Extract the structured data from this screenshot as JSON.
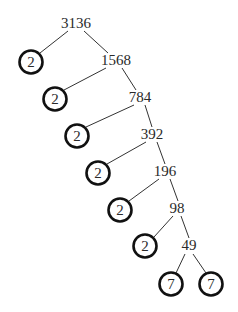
{
  "diagram": {
    "type": "factor-tree",
    "root": "3136",
    "composites": [
      {
        "value": "3136",
        "x": 76,
        "y": 28
      },
      {
        "value": "1568",
        "x": 115,
        "y": 65
      },
      {
        "value": "784",
        "x": 140,
        "y": 102
      },
      {
        "value": "392",
        "x": 152,
        "y": 139
      },
      {
        "value": "196",
        "x": 165,
        "y": 176
      },
      {
        "value": "98",
        "x": 177,
        "y": 213
      },
      {
        "value": "49",
        "x": 189,
        "y": 250
      }
    ],
    "primes": [
      {
        "value": "2",
        "x": 31,
        "y": 62
      },
      {
        "value": "2",
        "x": 55,
        "y": 99
      },
      {
        "value": "2",
        "x": 77,
        "y": 136
      },
      {
        "value": "2",
        "x": 98,
        "y": 173
      },
      {
        "value": "2",
        "x": 120,
        "y": 210
      },
      {
        "value": "2",
        "x": 145,
        "y": 246
      },
      {
        "value": "7",
        "x": 171,
        "y": 284
      },
      {
        "value": "7",
        "x": 211,
        "y": 284
      }
    ],
    "colors": {
      "text": "#2a2a2a",
      "circle": "#111111",
      "line": "#333333"
    }
  }
}
